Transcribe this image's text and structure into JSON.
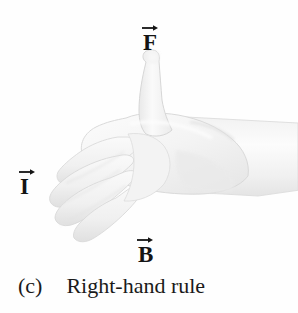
{
  "figure": {
    "caption_index": "(c)",
    "caption_text": "Right-hand rule",
    "background_color": "#fefefe",
    "ink_color": "#141414"
  },
  "labels": {
    "force": {
      "symbol": "F",
      "name": "force-vector-label",
      "arrow": "vector-arrow-overbar"
    },
    "current": {
      "symbol": "I",
      "name": "current-vector-label",
      "arrow": "vector-arrow-overbar"
    },
    "field": {
      "symbol": "B",
      "name": "magnetic-field-vector-label",
      "arrow": "vector-arrow-overbar"
    }
  },
  "illustration": {
    "name": "right-hand-photograph",
    "description": "Right hand with thumb extended upward and fingers curled, palm facing left",
    "tones": {
      "outline": "#d8d8d8",
      "midtone": "#efefef",
      "highlight": "#fbfbfb",
      "shadow": "#e2e2e2",
      "deep_shadow": "#d2d2d2"
    }
  }
}
